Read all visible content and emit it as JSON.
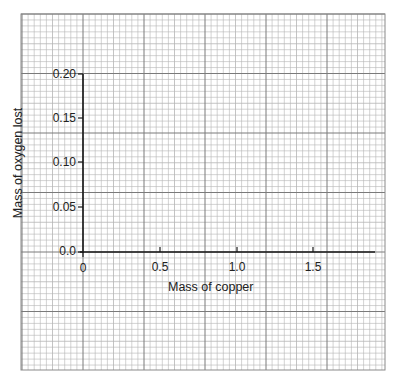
{
  "chart_data": {
    "type": "line",
    "title": "",
    "xlabel": "Mass of copper",
    "ylabel": "Mass of oxygen lost",
    "x_ticks": [
      "0",
      "0.5",
      "1.0",
      "1.5"
    ],
    "y_ticks": [
      "0.0",
      "0.05",
      "0.10",
      "0.15",
      "0.20"
    ],
    "xlim": [
      0,
      1.9
    ],
    "ylim": [
      0,
      0.2
    ],
    "grid": true,
    "grid_style": "graph paper (fine + major lines)",
    "series": [],
    "legend": null
  },
  "labels": {
    "x_axis_title": "Mass of copper",
    "y_axis_title": "Mass of oxygen lost",
    "x_tick_0": "0",
    "x_tick_1": "0.5",
    "x_tick_2": "1.0",
    "x_tick_3": "1.5",
    "y_tick_0": "0.0",
    "y_tick_1": "0.05",
    "y_tick_2": "0.10",
    "y_tick_3": "0.15",
    "y_tick_4": "0.20"
  },
  "colors": {
    "grid_fine": "#b5b5b5",
    "grid_major": "#7a7a7a",
    "axis": "#1a1a1a"
  }
}
